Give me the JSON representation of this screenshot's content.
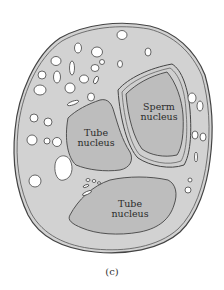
{
  "figure": {
    "caption": "(c)",
    "colors": {
      "cytoplasm": "#d2d2d2",
      "nucleus": "#bdbdbd",
      "outline": "#444444",
      "vacuole": "#ffffff",
      "background": "#ffffff"
    },
    "labels": {
      "sperm_nucleus": {
        "line1": "Sperm",
        "line2": "nucleus"
      },
      "tube_nucleus_upper": {
        "line1": "Tube",
        "line2": "nucleus"
      },
      "tube_nucleus_lower": {
        "line1": "Tube",
        "line2": "nucleus"
      }
    }
  }
}
